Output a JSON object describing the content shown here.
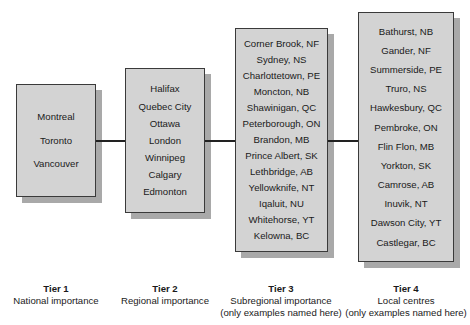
{
  "tiers": [
    {
      "title": "Tier 1",
      "subtitle": "National importance",
      "note": "",
      "cities": [
        "Montreal",
        "Toronto",
        "Vancouver"
      ]
    },
    {
      "title": "Tier 2",
      "subtitle": "Regional importance",
      "note": "",
      "cities": [
        "Halifax",
        "Quebec City",
        "Ottawa",
        "London",
        "Winnipeg",
        "Calgary",
        "Edmonton"
      ]
    },
    {
      "title": "Tier 3",
      "subtitle": "Subregional importance",
      "note": "(only examples named here)",
      "cities": [
        "Corner Brook, NF",
        "Sydney, NS",
        "Charlottetown, PE",
        "Moncton, NB",
        "Shawinigan, QC",
        "Peterborough, ON",
        "Brandon, MB",
        "Prince Albert, SK",
        "Lethbridge, AB",
        "Yellowknife, NT",
        "Iqaluit, NU",
        "Whitehorse, YT",
        "Kelowna, BC"
      ]
    },
    {
      "title": "Tier 4",
      "subtitle": "Local centres",
      "note": "(only examples named here)",
      "cities": [
        "Bathurst, NB",
        "Gander, NF",
        "Summerside, PE",
        "Truro, NS",
        "Hawkesbury, QC",
        "Pembroke, ON",
        "Flin Flon, MB",
        "Yorkton, SK",
        "Camrose, AB",
        "Inuvik, NT",
        "Dawson City, YT",
        "Castlegar, BC"
      ]
    }
  ],
  "colors": {
    "box_fill": "#d3d3d3",
    "box_shadow": "#a9a9a9",
    "border": "#3a3a3a",
    "connector": "#222222"
  }
}
